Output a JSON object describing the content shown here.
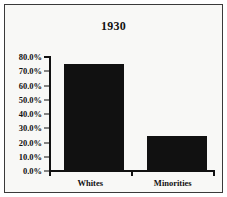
{
  "chart_data": {
    "type": "bar",
    "title": "1930",
    "xlabel": "",
    "ylabel": "",
    "categories": [
      "Whites",
      "Minorities"
    ],
    "values": [
      75.0,
      24.5
    ],
    "value_labels": [
      "75.0%",
      "24.5%"
    ],
    "ylim": [
      0.0,
      80.0
    ],
    "ytick_values": [
      0.0,
      10.0,
      20.0,
      30.0,
      40.0,
      50.0,
      60.0,
      70.0,
      80.0
    ],
    "ytick_labels": [
      "0.0%",
      "10.0%",
      "20.0%",
      "30.0%",
      "40.0%",
      "50.0%",
      "60.0%",
      "70.0%",
      "80.0%"
    ],
    "grid": false,
    "legend": false,
    "bar_color": "#111111",
    "background_color": "#f8f8f6",
    "frame_color": "#3a3a3a",
    "text_color": "#111111"
  }
}
